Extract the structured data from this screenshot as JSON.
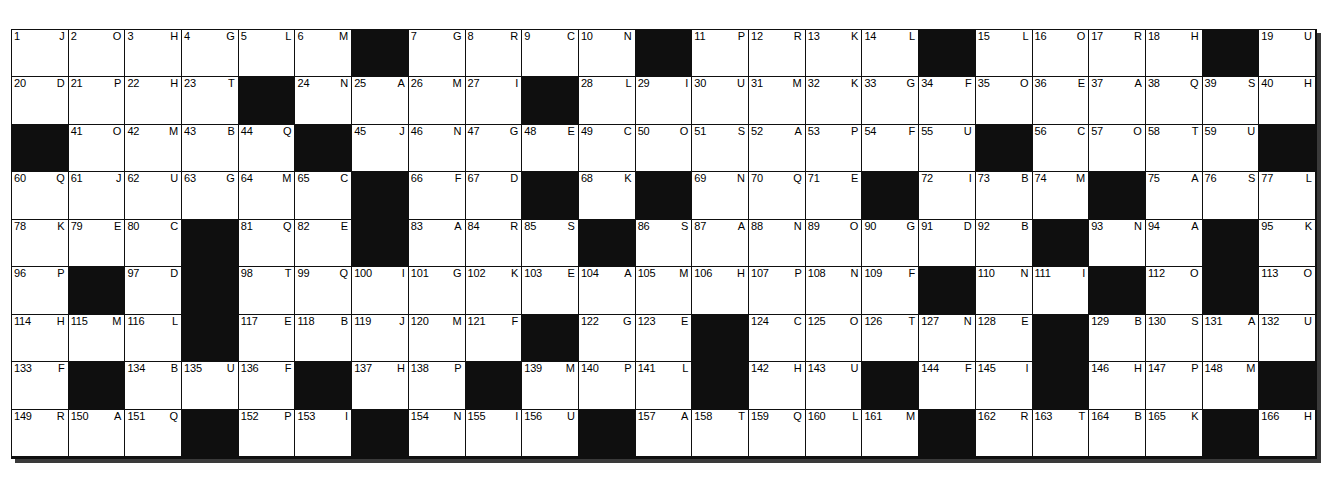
{
  "puzzle": {
    "kind": "acrostic-puzzle-grid",
    "columns": 23,
    "rows": 9,
    "colors": {
      "block": "#0f0f0f",
      "cell": "#ffffff",
      "text": "#000000",
      "page": "#ffffff",
      "shadow": "#3a3a3a"
    },
    "cells": [
      [
        {
          "n": "1",
          "c": "J"
        },
        {
          "n": "2",
          "c": "O"
        },
        {
          "n": "3",
          "c": "H"
        },
        {
          "n": "4",
          "c": "G"
        },
        {
          "n": "5",
          "c": "L"
        },
        {
          "n": "6",
          "c": "M"
        },
        {
          "block": true
        },
        {
          "n": "7",
          "c": "G"
        },
        {
          "n": "8",
          "c": "R"
        },
        {
          "n": "9",
          "c": "C"
        },
        {
          "n": "10",
          "c": "N"
        },
        {
          "block": true
        },
        {
          "n": "11",
          "c": "P"
        },
        {
          "n": "12",
          "c": "R"
        },
        {
          "n": "13",
          "c": "K"
        },
        {
          "n": "14",
          "c": "L"
        },
        {
          "block": true
        },
        {
          "n": "15",
          "c": "L"
        },
        {
          "n": "16",
          "c": "O"
        },
        {
          "n": "17",
          "c": "R"
        },
        {
          "n": "18",
          "c": "H"
        },
        {
          "block": true
        },
        {
          "n": "19",
          "c": "U"
        }
      ],
      [
        {
          "n": "20",
          "c": "D"
        },
        {
          "n": "21",
          "c": "P"
        },
        {
          "n": "22",
          "c": "H"
        },
        {
          "n": "23",
          "c": "T"
        },
        {
          "block": true
        },
        {
          "n": "24",
          "c": "N"
        },
        {
          "n": "25",
          "c": "A"
        },
        {
          "n": "26",
          "c": "M"
        },
        {
          "n": "27",
          "c": "I"
        },
        {
          "block": true
        },
        {
          "n": "28",
          "c": "L"
        },
        {
          "n": "29",
          "c": "I"
        },
        {
          "n": "30",
          "c": "U"
        },
        {
          "n": "31",
          "c": "M"
        },
        {
          "n": "32",
          "c": "K"
        },
        {
          "n": "33",
          "c": "G"
        },
        {
          "n": "34",
          "c": "F"
        },
        {
          "n": "35",
          "c": "O"
        },
        {
          "n": "36",
          "c": "E"
        },
        {
          "n": "37",
          "c": "A"
        },
        {
          "n": "38",
          "c": "Q"
        },
        {
          "n": "39",
          "c": "S"
        },
        {
          "n": "40",
          "c": "H"
        }
      ],
      [
        {
          "block": true
        },
        {
          "n": "41",
          "c": "O"
        },
        {
          "n": "42",
          "c": "M"
        },
        {
          "n": "43",
          "c": "B"
        },
        {
          "n": "44",
          "c": "Q"
        },
        {
          "block": true
        },
        {
          "n": "45",
          "c": "J"
        },
        {
          "n": "46",
          "c": "N"
        },
        {
          "n": "47",
          "c": "G"
        },
        {
          "n": "48",
          "c": "E"
        },
        {
          "n": "49",
          "c": "C"
        },
        {
          "n": "50",
          "c": "O"
        },
        {
          "n": "51",
          "c": "S"
        },
        {
          "n": "52",
          "c": "A"
        },
        {
          "n": "53",
          "c": "P"
        },
        {
          "n": "54",
          "c": "F"
        },
        {
          "n": "55",
          "c": "U"
        },
        {
          "block": true
        },
        {
          "n": "56",
          "c": "C"
        },
        {
          "n": "57",
          "c": "O"
        },
        {
          "n": "58",
          "c": "T"
        },
        {
          "n": "59",
          "c": "U"
        },
        {
          "block": true
        }
      ],
      [
        {
          "n": "60",
          "c": "Q"
        },
        {
          "n": "61",
          "c": "J"
        },
        {
          "n": "62",
          "c": "U"
        },
        {
          "n": "63",
          "c": "G"
        },
        {
          "n": "64",
          "c": "M"
        },
        {
          "n": "65",
          "c": "C"
        },
        {
          "block": true
        },
        {
          "n": "66",
          "c": "F"
        },
        {
          "n": "67",
          "c": "D"
        },
        {
          "block": true
        },
        {
          "n": "68",
          "c": "K"
        },
        {
          "block": true
        },
        {
          "n": "69",
          "c": "N"
        },
        {
          "n": "70",
          "c": "Q"
        },
        {
          "n": "71",
          "c": "E"
        },
        {
          "block": true
        },
        {
          "n": "72",
          "c": "I"
        },
        {
          "n": "73",
          "c": "B"
        },
        {
          "n": "74",
          "c": "M"
        },
        {
          "block": true
        },
        {
          "n": "75",
          "c": "A"
        },
        {
          "n": "76",
          "c": "S"
        },
        {
          "n": "77",
          "c": "L"
        }
      ],
      [
        {
          "n": "78",
          "c": "K"
        },
        {
          "n": "79",
          "c": "E"
        },
        {
          "n": "80",
          "c": "C"
        },
        {
          "block": true
        },
        {
          "n": "81",
          "c": "Q"
        },
        {
          "n": "82",
          "c": "E"
        },
        {
          "block": true
        },
        {
          "n": "83",
          "c": "A"
        },
        {
          "n": "84",
          "c": "R"
        },
        {
          "n": "85",
          "c": "S"
        },
        {
          "block": true
        },
        {
          "n": "86",
          "c": "S"
        },
        {
          "n": "87",
          "c": "A"
        },
        {
          "n": "88",
          "c": "N"
        },
        {
          "n": "89",
          "c": "O"
        },
        {
          "n": "90",
          "c": "G"
        },
        {
          "n": "91",
          "c": "D"
        },
        {
          "n": "92",
          "c": "B"
        },
        {
          "block": true
        },
        {
          "n": "93",
          "c": "N"
        },
        {
          "n": "94",
          "c": "A"
        },
        {
          "block": true
        },
        {
          "n": "95",
          "c": "K"
        },
        {
          "n": "96",
          "c": "P"
        }
      ],
      [
        {
          "block": true
        },
        {
          "n": "97",
          "c": "D"
        },
        {
          "block": true
        },
        {
          "n": "98",
          "c": "T"
        },
        {
          "n": "99",
          "c": "Q"
        },
        {
          "n": "100",
          "c": "I"
        },
        {
          "n": "101",
          "c": "G"
        },
        {
          "n": "102",
          "c": "K"
        },
        {
          "n": "103",
          "c": "E"
        },
        {
          "n": "104",
          "c": "A"
        },
        {
          "n": "105",
          "c": "M"
        },
        {
          "n": "106",
          "c": "H"
        },
        {
          "n": "107",
          "c": "P"
        },
        {
          "n": "108",
          "c": "N"
        },
        {
          "n": "109",
          "c": "F"
        },
        {
          "block": true
        },
        {
          "n": "110",
          "c": "N"
        },
        {
          "n": "111",
          "c": "I"
        },
        {
          "block": true
        },
        {
          "n": "112",
          "c": "O"
        },
        {
          "block": true
        },
        {
          "n": "113",
          "c": "O"
        },
        {
          "n": "114",
          "c": "H"
        },
        {
          "n": "115",
          "c": "M"
        }
      ],
      [
        {
          "n": "116",
          "c": "L"
        },
        {
          "block": true
        },
        {
          "n": "117",
          "c": "E"
        },
        {
          "n": "118",
          "c": "B"
        },
        {
          "n": "119",
          "c": "J"
        },
        {
          "n": "120",
          "c": "M"
        },
        {
          "n": "121",
          "c": "F"
        },
        {
          "block": true
        },
        {
          "n": "122",
          "c": "G"
        },
        {
          "n": "123",
          "c": "E"
        },
        {
          "block": true
        },
        {
          "n": "124",
          "c": "C"
        },
        {
          "n": "125",
          "c": "O"
        },
        {
          "n": "126",
          "c": "T"
        },
        {
          "n": "127",
          "c": "N"
        },
        {
          "n": "128",
          "c": "E"
        },
        {
          "block": true
        },
        {
          "n": "129",
          "c": "B"
        },
        {
          "n": "130",
          "c": "S"
        },
        {
          "n": "131",
          "c": "A"
        },
        {
          "n": "132",
          "c": "U"
        },
        {
          "n": "133",
          "c": "F"
        },
        {
          "block": true
        }
      ],
      [
        {
          "n": "134",
          "c": "B"
        },
        {
          "n": "135",
          "c": "U"
        },
        {
          "n": "136",
          "c": "F"
        },
        {
          "block": true
        },
        {
          "n": "137",
          "c": "H"
        },
        {
          "n": "138",
          "c": "P"
        },
        {
          "block": true
        },
        {
          "n": "139",
          "c": "M"
        },
        {
          "n": "140",
          "c": "P"
        },
        {
          "n": "141",
          "c": "L"
        },
        {
          "block": true
        },
        {
          "n": "142",
          "c": "H"
        },
        {
          "n": "143",
          "c": "U"
        },
        {
          "block": true
        },
        {
          "n": "144",
          "c": "F"
        },
        {
          "n": "145",
          "c": "I"
        },
        {
          "block": true
        },
        {
          "n": "146",
          "c": "H"
        },
        {
          "n": "147",
          "c": "P"
        },
        {
          "n": "148",
          "c": "M"
        },
        {
          "block": true
        },
        {
          "n": "149",
          "c": "R"
        },
        {
          "n": "150",
          "c": "A"
        }
      ],
      [
        {
          "n": "151",
          "c": "Q"
        },
        {
          "block": true
        },
        {
          "n": "152",
          "c": "P"
        },
        {
          "n": "153",
          "c": "I"
        },
        {
          "block": true
        },
        {
          "n": "154",
          "c": "N"
        },
        {
          "n": "155",
          "c": "I"
        },
        {
          "n": "156",
          "c": "U"
        },
        {
          "block": true
        },
        {
          "n": "157",
          "c": "A"
        },
        {
          "n": "158",
          "c": "T"
        },
        {
          "n": "159",
          "c": "Q"
        },
        {
          "n": "160",
          "c": "L"
        },
        {
          "n": "161",
          "c": "M"
        },
        {
          "block": true
        },
        {
          "n": "162",
          "c": "R"
        },
        {
          "n": "163",
          "c": "T"
        },
        {
          "n": "164",
          "c": "B"
        },
        {
          "n": "165",
          "c": "K"
        },
        {
          "block": true
        },
        {
          "n": "166",
          "c": "H"
        },
        {
          "n": "167",
          "c": "Q"
        },
        {
          "n": "168",
          "c": "E"
        },
        {
          "n": "169",
          "c": "S"
        }
      ]
    ]
  }
}
